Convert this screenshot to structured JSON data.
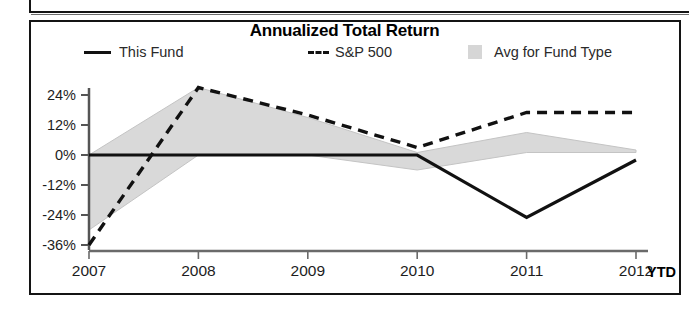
{
  "chart_data": {
    "type": "line",
    "title": "Annualized Total Return",
    "xlabel": "",
    "ylabel": "",
    "categories": [
      "2007",
      "2008",
      "2009",
      "2010",
      "2011",
      "2012"
    ],
    "x_axis_note": "YTD",
    "xtick_labels": [
      "2007",
      "2008",
      "2009",
      "2010",
      "2011",
      "2012"
    ],
    "ytick_labels": [
      "24%",
      "12%",
      "0%",
      "-12%",
      "-24%",
      "-36%"
    ],
    "ytick_values": [
      24,
      12,
      0,
      -12,
      -24,
      -36
    ],
    "ylim": [
      -40,
      30
    ],
    "grid": false,
    "legend_position": "top",
    "series": [
      {
        "name": "This Fund",
        "style": "solid",
        "color": "#111111",
        "values": [
          0,
          0,
          0,
          0,
          -25,
          -2
        ]
      },
      {
        "name": "S&P 500",
        "style": "dashed",
        "color": "#111111",
        "values": [
          -36,
          27,
          16,
          3,
          17,
          17
        ]
      },
      {
        "name": "Avg for Fund Type",
        "style": "band",
        "color": "#d9d9d9",
        "band_upper": [
          0,
          27,
          15,
          1,
          9,
          2
        ],
        "band_lower": [
          -30,
          0,
          0,
          -6,
          1,
          1
        ]
      }
    ]
  },
  "chart": {
    "title": "Annualized Total Return",
    "legend": [
      {
        "label": "This Fund",
        "marker": "solid-line-swatch"
      },
      {
        "label": "S&P 500",
        "marker": "dashed-line-swatch"
      },
      {
        "label": "Avg for Fund Type",
        "marker": "area-swatch"
      }
    ],
    "axis": {
      "y_ticks": [
        "24%",
        "12%",
        "0%",
        "-12%",
        "-24%",
        "-36%"
      ],
      "x_ticks": [
        "2007",
        "2008",
        "2009",
        "2010",
        "2011",
        "2012"
      ],
      "x_suffix": "YTD"
    },
    "colors": {
      "line": "#111111",
      "band": "#d9d9d9",
      "frame": "#141414",
      "text": "#1d1d1d"
    }
  }
}
